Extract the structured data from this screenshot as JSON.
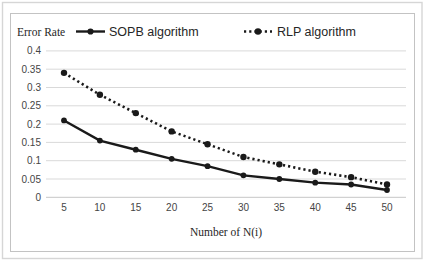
{
  "window": {
    "background": "#ffffff",
    "outer_border_color": "#d0d0d0",
    "frame_border_color": "#c3c3c3"
  },
  "chart_data": {
    "type": "line",
    "title": "",
    "ylabel": "Error Rate",
    "xlabel": "Number of N(i)",
    "x": [
      5,
      10,
      15,
      20,
      25,
      30,
      35,
      40,
      45,
      50
    ],
    "series": [
      {
        "name": "SOPB algorithm",
        "line_style": "solid",
        "marker": "filled-circle",
        "color": "#1a1a1a",
        "values": [
          0.21,
          0.155,
          0.13,
          0.105,
          0.085,
          0.06,
          0.05,
          0.04,
          0.035,
          0.02
        ]
      },
      {
        "name": "RLP algorithm",
        "line_style": "dotted",
        "marker": "filled-circle",
        "color": "#1a1a1a",
        "values": [
          0.34,
          0.28,
          0.23,
          0.18,
          0.145,
          0.11,
          0.09,
          0.07,
          0.055,
          0.035
        ]
      }
    ],
    "ylim": [
      0,
      0.4
    ],
    "ytick_step": 0.05,
    "yticks": [
      0,
      0.05,
      0.1,
      0.15,
      0.2,
      0.25,
      0.3,
      0.35,
      0.4
    ],
    "grid": "horizontal",
    "gridline_color": "#d9d9d9",
    "axis_line_color": "#c6c6c6",
    "legend_position": "top"
  }
}
